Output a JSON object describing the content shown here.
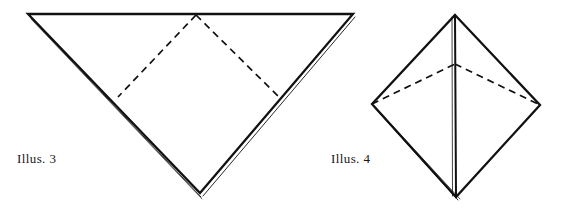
{
  "page": {
    "background_color": "#ffffff",
    "ink_color": "#111111",
    "width": 566,
    "height": 213
  },
  "figures": [
    {
      "id": "illus-3",
      "label": "Illus. 3",
      "label_position": {
        "x": 17,
        "y": 152
      },
      "shape": "downward-pointing-triangle",
      "description": "Folded square shown as a downward pointing triangle with dashed fold lines forming an inner inverted V",
      "solid_outline": {
        "stroke_color": "#111111",
        "stroke_width": 2.2,
        "points": [
          {
            "x": 28,
            "y": 14
          },
          {
            "x": 353,
            "y": 14
          },
          {
            "x": 200,
            "y": 193
          }
        ]
      },
      "double_edge_offsets": [
        {
          "from": {
            "x": 30,
            "y": 17
          },
          "to": {
            "x": 201,
            "y": 197
          },
          "stroke_width": 0.9
        },
        {
          "from": {
            "x": 355,
            "y": 17
          },
          "to": {
            "x": 203,
            "y": 196
          },
          "stroke_width": 0.9
        }
      ],
      "dashed_fold_lines": [
        {
          "from": {
            "x": 196,
            "y": 15
          },
          "to": {
            "x": 118,
            "y": 97
          }
        },
        {
          "from": {
            "x": 196,
            "y": 15
          },
          "to": {
            "x": 281,
            "y": 99
          }
        }
      ],
      "dash_pattern": "7 5"
    },
    {
      "id": "illus-4",
      "label": "Illus. 4",
      "label_position": {
        "x": 331,
        "y": 152
      },
      "shape": "diamond-kite",
      "description": "Folded paper shown as a diamond with a vertical center crease and a shallow dashed fold arc across the upper half",
      "solid_outline": {
        "stroke_color": "#111111",
        "stroke_width": 2.2,
        "points": [
          {
            "x": 455,
            "y": 15
          },
          {
            "x": 540,
            "y": 105
          },
          {
            "x": 456,
            "y": 197
          },
          {
            "x": 372,
            "y": 104
          }
        ]
      },
      "center_crease": {
        "from": {
          "x": 455,
          "y": 15
        },
        "to": {
          "x": 456,
          "y": 197
        },
        "stroke_width": 2.0
      },
      "double_edge_offsets": [
        {
          "from": {
            "x": 374,
            "y": 107
          },
          "to": {
            "x": 458,
            "y": 200
          },
          "stroke_width": 0.9
        },
        {
          "from": {
            "x": 376,
            "y": 108
          },
          "to": {
            "x": 460,
            "y": 199
          },
          "stroke_width": 0.7
        },
        {
          "from": {
            "x": 452,
            "y": 16
          },
          "to": {
            "x": 452,
            "y": 196
          },
          "stroke_width": 0.8
        }
      ],
      "dashed_fold_lines": [
        {
          "from": {
            "x": 372,
            "y": 104
          },
          "to": {
            "x": 455,
            "y": 64
          }
        },
        {
          "from": {
            "x": 455,
            "y": 64
          },
          "to": {
            "x": 540,
            "y": 105
          }
        }
      ],
      "dash_pattern": "7 5"
    }
  ]
}
